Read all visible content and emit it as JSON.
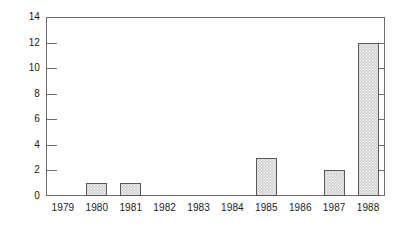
{
  "chart_data": {
    "type": "bar",
    "title": "",
    "subtitle": "",
    "xlabel": "",
    "ylabel": "",
    "categories": [
      "1979",
      "1980",
      "1981",
      "1982",
      "1983",
      "1984",
      "1985",
      "1986",
      "1987",
      "1988"
    ],
    "values": [
      0,
      1,
      1,
      0,
      0,
      0,
      3,
      0,
      2,
      12
    ],
    "ylim": [
      0,
      14
    ],
    "ytick_labels": [
      "0",
      "2",
      "4",
      "6",
      "8",
      "10",
      "12",
      "14"
    ],
    "ytick_values": [
      0,
      2,
      4,
      6,
      8,
      10,
      12,
      14
    ],
    "grid": false,
    "legend": null,
    "annotations": [],
    "colors": {
      "bar_fill": "#d4d4d4",
      "bar_border": "#5a5a5a",
      "axis": "#6e6e6e",
      "text": "#1a1a1a",
      "background": "#ffffff"
    }
  }
}
